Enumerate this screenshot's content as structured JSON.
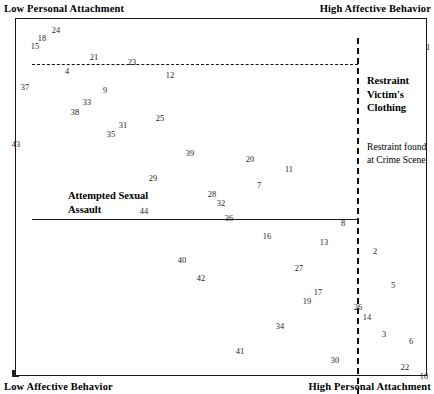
{
  "chart_data": {
    "type": "scatter",
    "title": "",
    "subtitle": "",
    "xlabel": "",
    "ylabel": "",
    "xlim": [
      0,
      100
    ],
    "ylim": [
      0,
      100
    ],
    "grid": false,
    "legend_position": "none",
    "axis_labels": {
      "top_left": "Low Personal Attachment",
      "top_right": "High Affective Behavior",
      "bottom_left": "Low Affective Behavior",
      "bottom_right": "High Personal  Attachment"
    },
    "regions": [
      {
        "name": "restraint-victims-clothing",
        "label": "Restraint\nVictim's\nClothing",
        "style": "bold"
      },
      {
        "name": "restraint-found-at-crime-scene",
        "label": "Restraint found\nat Crime Scene",
        "style": "regular"
      },
      {
        "name": "attempted-sexual-assault",
        "label": "Attempted Sexual\nAssault",
        "style": "bold"
      }
    ],
    "partitions": [
      {
        "name": "upper-dashed-horizontal",
        "orientation": "horizontal",
        "style": "dashed"
      },
      {
        "name": "middle-solid-horizontal",
        "orientation": "horizontal",
        "style": "solid"
      },
      {
        "name": "right-dashed-vertical",
        "orientation": "vertical",
        "style": "dashed"
      }
    ],
    "points": [
      {
        "label": "24",
        "x": 55,
        "y": 29
      },
      {
        "label": "18",
        "x": 41,
        "y": 37
      },
      {
        "label": "15",
        "x": 34,
        "y": 45
      },
      {
        "label": "21",
        "x": 93,
        "y": 56
      },
      {
        "label": "23",
        "x": 131,
        "y": 61
      },
      {
        "label": "4",
        "x": 66,
        "y": 70
      },
      {
        "label": "12",
        "x": 169,
        "y": 74
      },
      {
        "label": "37",
        "x": 24,
        "y": 86
      },
      {
        "label": "9",
        "x": 104,
        "y": 89
      },
      {
        "label": "33",
        "x": 86,
        "y": 101
      },
      {
        "label": "38",
        "x": 74,
        "y": 111
      },
      {
        "label": "25",
        "x": 159,
        "y": 117
      },
      {
        "label": "31",
        "x": 122,
        "y": 124
      },
      {
        "label": "35",
        "x": 110,
        "y": 133
      },
      {
        "label": "43",
        "x": 15,
        "y": 143
      },
      {
        "label": "39",
        "x": 189,
        "y": 152
      },
      {
        "label": "20",
        "x": 249,
        "y": 158
      },
      {
        "label": "11",
        "x": 288,
        "y": 168
      },
      {
        "label": "29",
        "x": 152,
        "y": 177
      },
      {
        "label": "7",
        "x": 258,
        "y": 184
      },
      {
        "label": "28",
        "x": 211,
        "y": 193
      },
      {
        "label": "32",
        "x": 220,
        "y": 202
      },
      {
        "label": "44",
        "x": 143,
        "y": 210
      },
      {
        "label": "36",
        "x": 228,
        "y": 217
      },
      {
        "label": "8",
        "x": 342,
        "y": 222
      },
      {
        "label": "16",
        "x": 266,
        "y": 235
      },
      {
        "label": "13",
        "x": 323,
        "y": 241
      },
      {
        "label": "2",
        "x": 374,
        "y": 250
      },
      {
        "label": "40",
        "x": 181,
        "y": 259
      },
      {
        "label": "27",
        "x": 298,
        "y": 267
      },
      {
        "label": "42",
        "x": 200,
        "y": 277
      },
      {
        "label": "5",
        "x": 392,
        "y": 284
      },
      {
        "label": "17",
        "x": 317,
        "y": 291
      },
      {
        "label": "19",
        "x": 306,
        "y": 300
      },
      {
        "label": "26",
        "x": 357,
        "y": 306
      },
      {
        "label": "14",
        "x": 366,
        "y": 316
      },
      {
        "label": "34",
        "x": 279,
        "y": 325
      },
      {
        "label": "3",
        "x": 383,
        "y": 333
      },
      {
        "label": "6",
        "x": 410,
        "y": 340
      },
      {
        "label": "41",
        "x": 239,
        "y": 350
      },
      {
        "label": "30",
        "x": 334,
        "y": 359
      },
      {
        "label": "22",
        "x": 404,
        "y": 366
      },
      {
        "label": "10",
        "x": 423,
        "y": 375
      },
      {
        "label": "1",
        "x": 427,
        "y": 46
      }
    ]
  }
}
